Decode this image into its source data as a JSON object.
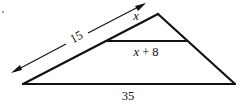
{
  "diagram": {
    "type": "similar-triangles-parallel-segment",
    "labels": {
      "side_total": "15",
      "side_top_part": "x",
      "inner_segment": "x + 8",
      "inner_segment_var": "x",
      "inner_segment_rest": " + 8",
      "base": "35"
    },
    "colors": {
      "stroke": "#111111",
      "background": "#ffffff"
    }
  }
}
